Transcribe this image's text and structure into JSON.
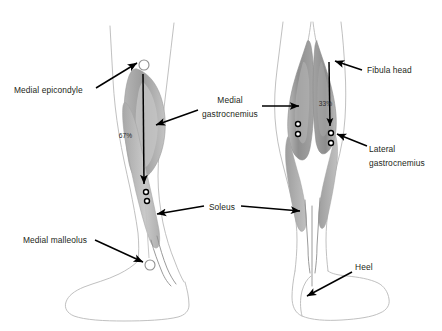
{
  "figure": {
    "background_color": "#ffffff",
    "width": 442,
    "height": 331,
    "muscle_fill_color": "#9a9a9a",
    "muscle_fill_light": "#b8b8b8",
    "outline_color": "#b9b9b9",
    "leader_color": "#000000",
    "text_color": "#231f20"
  },
  "labels": {
    "medial_epicondyle": "Medial epicondyle",
    "medial_malleolus": "Medial malleolus",
    "medial_gastrocnemius_line1": "Medial",
    "medial_gastrocnemius_line2": "gastrocnemius",
    "soleus": "Soleus",
    "fibula_head": "Fibula head",
    "lateral_gastrocnemius_line1": "Lateral",
    "lateral_gastrocnemius_line2": "gastrocnemius",
    "heel": "Heel"
  },
  "measurements": {
    "left_figure_percent": "67%",
    "right_figure_percent": "33%"
  },
  "views": {
    "left": "medial side view of lower leg and foot",
    "right": "posterior view of both lower legs and foot"
  },
  "electrodes": {
    "left_view_count": 2,
    "right_medial_count": 2,
    "right_lateral_count": 2
  },
  "landmarks": {
    "left_top_marker": "medial epicondyle ring marker",
    "left_bottom_marker": "medial malleolus ring marker"
  }
}
